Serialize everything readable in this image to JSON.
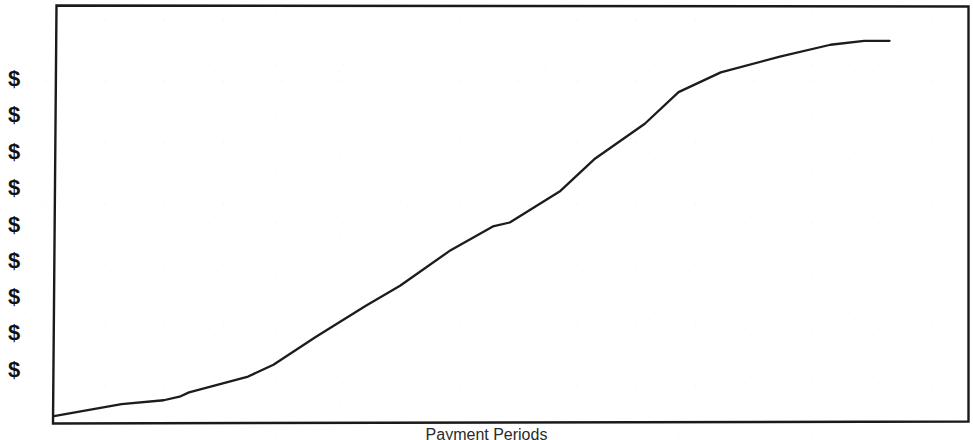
{
  "chart_data": {
    "type": "line",
    "title": "",
    "subtitle": "",
    "xlabel": "Payment Periods",
    "ylabel": "",
    "grid": false,
    "legend": null,
    "legend_position": "none",
    "axis_style": "open-frame, no numeric ticks",
    "ytick_labels": [
      "$",
      "$",
      "$",
      "$",
      "$",
      "$",
      "$",
      "$",
      "$"
    ],
    "xtick_labels": [],
    "xlim": [
      0,
      100
    ],
    "ylim": [
      0,
      100
    ],
    "annotations": [],
    "series": [
      {
        "name": "Cumulative Payment",
        "shape": "S-curve (logistic / sigmoid growth)",
        "x": [
          0,
          8,
          13,
          15,
          16,
          23,
          26,
          31,
          37,
          41,
          47,
          52,
          54,
          60,
          64,
          70,
          74,
          79,
          86,
          92,
          96,
          99
        ],
        "y": [
          1,
          4,
          5,
          6,
          7,
          11,
          14,
          21,
          29,
          34,
          43,
          49,
          50,
          58,
          66,
          75,
          83,
          88,
          92,
          95,
          96,
          96
        ]
      }
    ],
    "line_color": "#1c1c1c",
    "frame_color": "#1a1a1a",
    "background_color": "#ffffff"
  },
  "axes": {
    "x_axis_label": "Payment Periods",
    "y_axis_tick_symbol": "$",
    "y_axis_tick_count": 9
  },
  "colors": {
    "ink": "#1a1a1a",
    "line": "#1c1c1c",
    "paper": "#ffffff"
  }
}
